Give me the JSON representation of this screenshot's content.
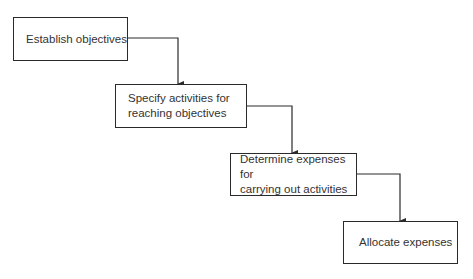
{
  "diagram": {
    "type": "flowchart-staircase",
    "steps": [
      {
        "label": "Establish objectives"
      },
      {
        "label": "Specify activities for reaching objectives",
        "lines": [
          "Specify activities for",
          "reaching objectives"
        ]
      },
      {
        "label": "Determine expenses for carrying out activities",
        "lines": [
          "Determine expenses for",
          "carrying out activities"
        ]
      },
      {
        "label": "Allocate expenses"
      }
    ],
    "connectors": [
      {
        "from": 0,
        "to": 1
      },
      {
        "from": 1,
        "to": 2
      },
      {
        "from": 2,
        "to": 3
      }
    ]
  }
}
